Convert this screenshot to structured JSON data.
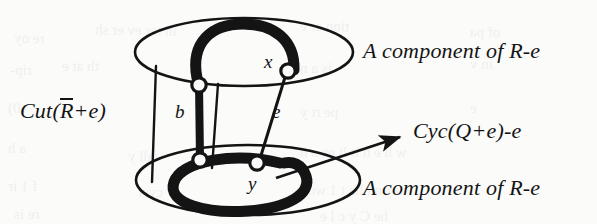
{
  "figure": {
    "background_color": "#fbfbfa",
    "ink_color": "#141414"
  },
  "labels": {
    "cut": {
      "prefix": "Cut(",
      "overbar_letter": "R",
      "suffix": "+e)"
    },
    "top_component": "A component of R-e",
    "bottom_component": "A component of R-e",
    "cycle": "Cyc(Q+e)-e",
    "node_x": "x",
    "node_y": "y",
    "edge_b": "b",
    "edge_e": "e"
  },
  "elements": {
    "top_ellipse_name": "top-component-ellipse",
    "bottom_ellipse_name": "bottom-component-ellipse",
    "thick_arc_top_name": "thick-path-top-component",
    "thick_arc_bottom_name": "thick-path-bottom-component",
    "edge_b_name": "thick-edge-b",
    "edge_e_name": "thin-edge-e",
    "node_x_name": "node-x",
    "node_y_name": "node-y",
    "node_b_top_name": "node-b-top",
    "node_b_bottom_name": "node-b-bottom",
    "cut_line_left_name": "cut-line-left",
    "cut_line_middle_name": "cut-line-middle",
    "pointer_arrow_name": "pointer-arrow-cycle"
  },
  "bleed_text": [
    {
      "t": "re oy",
      "x": 14,
      "y": 30,
      "s": 15,
      "r": -1
    },
    {
      "t": "in  ter  ev er  sh",
      "x": 95,
      "y": 22,
      "s": 15,
      "r": -1
    },
    {
      "t": "tion  ar  e",
      "x": 300,
      "y": 18,
      "s": 15,
      "r": -1
    },
    {
      "t": "of  pa",
      "x": 470,
      "y": 24,
      "s": 15,
      "r": -1
    },
    {
      "t": "rip-",
      "x": 10,
      "y": 62,
      "s": 15,
      "r": 0
    },
    {
      "t": "th at  e",
      "x": 62,
      "y": 58,
      "s": 15,
      "r": 0
    },
    {
      "t": "is a  n",
      "x": 300,
      "y": 60,
      "s": 15,
      "r": 0
    },
    {
      "t": "in  v",
      "x": 470,
      "y": 56,
      "s": 15,
      "r": 0
    },
    {
      "t": "0)",
      "x": 8,
      "y": 100,
      "s": 15,
      "r": 0
    },
    {
      "t": "pe rt  y",
      "x": 300,
      "y": 104,
      "s": 15,
      "r": 0
    },
    {
      "t": "e",
      "x": 470,
      "y": 100,
      "s": 15,
      "r": 0
    },
    {
      "t": "a h",
      "x": 8,
      "y": 140,
      "s": 15,
      "r": 0
    },
    {
      "t": "iall  y",
      "x": 128,
      "y": 148,
      "s": 15,
      "r": 0
    },
    {
      "t": "w h e n   it  li  es  o  n",
      "x": 300,
      "y": 144,
      "s": 15,
      "r": 0
    },
    {
      "t": "f 1  ir",
      "x": 8,
      "y": 178,
      "s": 15,
      "r": 0
    },
    {
      "t": "cycl",
      "x": 138,
      "y": 184,
      "s": 15,
      "r": 0
    },
    {
      "t": "tor  n  t  ha  t   1  wou",
      "x": 300,
      "y": 182,
      "s": 15,
      "r": 0
    },
    {
      "t": "re  is",
      "x": 14,
      "y": 206,
      "s": 15,
      "r": 0
    },
    {
      "t": "he   C  y  c  l  e",
      "x": 320,
      "y": 208,
      "s": 15,
      "r": 0
    }
  ]
}
